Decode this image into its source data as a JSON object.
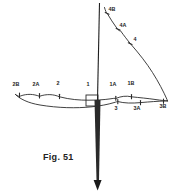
{
  "figure": {
    "caption": "Fig. 51",
    "background_color": "#ffffff",
    "line_color": "#2b2b2b",
    "axis_color": "#1f1f1f",
    "label_color": "#1c1c1c",
    "width": 191,
    "height": 192
  },
  "labels": {
    "left_branch": [
      {
        "id": "label-2B",
        "text": "2B",
        "x": 16,
        "y": 86
      },
      {
        "id": "label-2A",
        "text": "2A",
        "x": 36,
        "y": 86
      },
      {
        "id": "label-2",
        "text": "2",
        "x": 58,
        "y": 85
      }
    ],
    "center": [
      {
        "id": "label-1",
        "text": "1",
        "x": 88,
        "y": 86
      }
    ],
    "right_upper_branch": [
      {
        "id": "label-1A",
        "text": "1A",
        "x": 113,
        "y": 86
      },
      {
        "id": "label-1B",
        "text": "1B",
        "x": 131,
        "y": 85
      }
    ],
    "right_lower_branch": [
      {
        "id": "label-3",
        "text": "3",
        "x": 116,
        "y": 110
      },
      {
        "id": "label-3A",
        "text": "3A",
        "x": 137,
        "y": 110
      },
      {
        "id": "label-3B",
        "text": "3B",
        "x": 163,
        "y": 108
      }
    ],
    "descending_curve": [
      {
        "id": "label-4B",
        "text": "4B",
        "x": 108,
        "y": 10
      },
      {
        "id": "label-4A",
        "text": "4A",
        "x": 119,
        "y": 26
      },
      {
        "id": "label-4",
        "text": "4",
        "x": 131,
        "y": 40
      }
    ]
  },
  "ticks": {
    "upper_curve": [
      {
        "id": "tick-2B",
        "x": 19.5,
        "y": 95.5
      },
      {
        "id": "tick-2A",
        "x": 39.5,
        "y": 96.0
      },
      {
        "id": "tick-2",
        "x": 59.5,
        "y": 96.5
      },
      {
        "id": "tick-1A",
        "x": 115.5,
        "y": 98.0
      },
      {
        "id": "tick-1B",
        "x": 131.5,
        "y": 96.5
      }
    ],
    "lower_curve": [
      {
        "id": "tick-3",
        "x": 117.5,
        "y": 101.5
      },
      {
        "id": "tick-3A",
        "x": 140.5,
        "y": 102.5
      },
      {
        "id": "tick-3B",
        "x": 163.5,
        "y": 101.0
      }
    ],
    "descending_curve": [
      {
        "id": "tick-4B",
        "x": 107.0,
        "y": 13.0
      },
      {
        "id": "tick-4A",
        "x": 118.0,
        "y": 29.0
      },
      {
        "id": "tick-4",
        "x": 130.0,
        "y": 43.5
      }
    ]
  },
  "geometry": {
    "axis_top_x": 99.5,
    "axis_top_y": 3,
    "axis_bottom_y": 183,
    "arrow_tip_y": 190,
    "center_box": {
      "x": 86,
      "y": 95,
      "width": 12,
      "height": 11
    }
  }
}
